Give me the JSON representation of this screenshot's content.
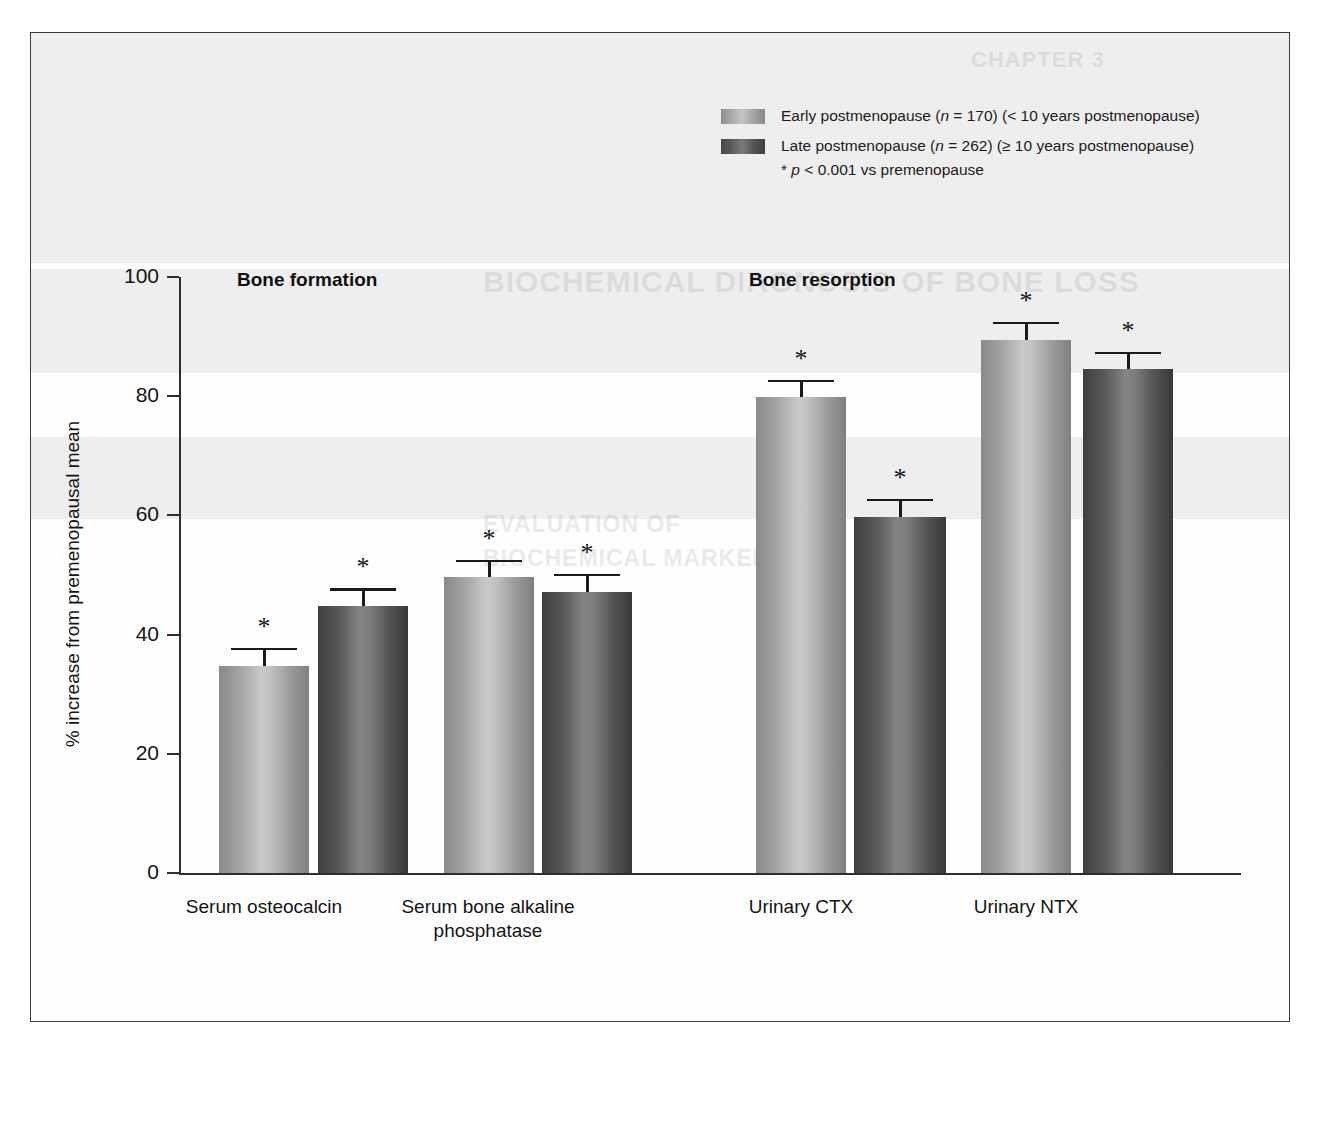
{
  "figure": {
    "y_axis_title": "% increase from premenopausal mean",
    "group_headings": [
      {
        "label": "Bone formation",
        "left": 206,
        "top": 236
      },
      {
        "label": "Bone resorption",
        "left": 718,
        "top": 236
      }
    ]
  },
  "legend": {
    "items": [
      {
        "swatch": "early",
        "name": "legend-item-early-postmenopause",
        "parts": [
          {
            "type": "text",
            "value": "Early postmenopause ("
          },
          {
            "type": "italic",
            "value": "n"
          },
          {
            "type": "text",
            "value": " = 170) (< 10 years postmenopause)"
          }
        ]
      },
      {
        "swatch": "late",
        "name": "legend-item-late-postmenopause",
        "parts": [
          {
            "type": "text",
            "value": "Late postmenopause ("
          },
          {
            "type": "italic",
            "value": "n"
          },
          {
            "type": "text",
            "value": " = 262) (≥ 10 years postmenopause)"
          }
        ]
      }
    ],
    "note_parts": [
      {
        "type": "text",
        "value": "* "
      },
      {
        "type": "italic",
        "value": "p"
      },
      {
        "type": "text",
        "value": " < 0.001 vs premenopause"
      }
    ],
    "early_label": "Early postmenopause (n = 170) (< 10 years postmenopause)",
    "late_label": "Late postmenopause (n = 262) (≥ 10 years postmenopause)",
    "significance_note": "* p < 0.001 vs premenopause"
  },
  "ghost_text": {
    "chapter": "CHAPTER 3",
    "heading": "BIOCHEMICAL DIAGNOSIS OF BONE LOSS",
    "subheading_1": "EVALUATION OF",
    "subheading_2": "BIOCHEMICAL MARKERS"
  },
  "colors": {
    "early_bar": "#b0b0b0",
    "late_bar": "#5e5e5e",
    "axis": "#2e2e2e",
    "text": "#141414",
    "frame": "#3c3c3c"
  },
  "chart_data": {
    "type": "bar",
    "title": "",
    "xlabel": "",
    "ylabel": "% increase from premenopausal mean",
    "ylim": [
      0,
      100
    ],
    "yticks": [
      0,
      20,
      40,
      60,
      80,
      100
    ],
    "grid": false,
    "legend_position": "top-center",
    "categories": [
      "Serum osteocalcin",
      "Serum bone alkaline phosphatase",
      "Urinary CTX",
      "Urinary NTX"
    ],
    "category_labels": [
      [
        "Serum osteocalcin"
      ],
      [
        "Serum bone alkaline",
        "phosphatase"
      ],
      [
        "Urinary CTX"
      ],
      [
        "Urinary NTX"
      ]
    ],
    "groups": [
      "Bone formation",
      "Bone formation",
      "Bone resorption",
      "Bone resorption"
    ],
    "series": [
      {
        "name": "Early postmenopause (n = 170) (< 10 years postmenopause)",
        "key": "early",
        "values": [
          34.8,
          49.6,
          79.8,
          89.5
        ],
        "errors": [
          3.0,
          3.0,
          3.0,
          3.0
        ],
        "significance": [
          "*",
          "*",
          "*",
          "*"
        ]
      },
      {
        "name": "Late postmenopause (n = 262) (≥ 10 years postmenopause)",
        "key": "late",
        "values": [
          44.8,
          47.2,
          59.8,
          84.5
        ],
        "errors": [
          3.0,
          3.0,
          3.0,
          3.0
        ],
        "significance": [
          "*",
          "*",
          "*",
          "*"
        ]
      }
    ],
    "annotation": "* p < 0.001 vs premenopause"
  },
  "layout": {
    "y_zero_px": 840,
    "px_per_unit": 5.96,
    "bars": [
      {
        "series": "early",
        "cat": 0,
        "left": 188,
        "width": 90
      },
      {
        "series": "late",
        "cat": 0,
        "left": 287,
        "width": 90
      },
      {
        "series": "early",
        "cat": 1,
        "left": 413,
        "width": 90
      },
      {
        "series": "late",
        "cat": 1,
        "left": 511,
        "width": 90
      },
      {
        "series": "early",
        "cat": 2,
        "left": 725,
        "width": 90
      },
      {
        "series": "late",
        "cat": 2,
        "left": 823,
        "width": 92
      },
      {
        "series": "early",
        "cat": 3,
        "left": 950,
        "width": 90
      },
      {
        "series": "late",
        "cat": 3,
        "left": 1052,
        "width": 90
      }
    ],
    "cat_label_centers": [
      233,
      457,
      770,
      995
    ],
    "cat_label_top": 862
  }
}
